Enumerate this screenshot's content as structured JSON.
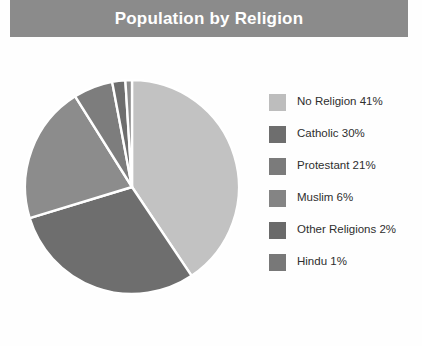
{
  "title": "Population by Religion",
  "theme": {
    "title_bar_bg": "#8b8b8b",
    "title_text_color": "#ffffff",
    "page_bg": "#fefefe",
    "legend_text_color": "#2e2e2e",
    "slice_separator": "#ffffff"
  },
  "chart_data": {
    "type": "pie",
    "title": "Population by Religion",
    "xlabel": "",
    "ylabel": "",
    "legend_position": "right",
    "start_angle_deg": 0,
    "direction": "clockwise",
    "units": "percent",
    "categories": [
      "No Religion",
      "Catholic",
      "Protestant",
      "Muslim",
      "Other Religions",
      "Hindu"
    ],
    "values": [
      41,
      30,
      21,
      6,
      2,
      1
    ],
    "colors": [
      "#c2c2c2",
      "#6e6e6e",
      "#8c8c8c",
      "#7d7d7d",
      "#6e6e6e",
      "#8c8c8c"
    ],
    "slices": [
      {
        "label": "No Religion",
        "value": 41,
        "display": "No Religion 41%",
        "color": "#c2c2c2"
      },
      {
        "label": "Catholic",
        "value": 30,
        "display": "Catholic 30%",
        "color": "#6e6e6e"
      },
      {
        "label": "Protestant",
        "value": 21,
        "display": "Protestant 21%",
        "color": "#8c8c8c"
      },
      {
        "label": "Muslim",
        "value": 6,
        "display": "Muslim 6%",
        "color": "#7d7d7d"
      },
      {
        "label": "Other Religions",
        "value": 2,
        "display": "Other Religions 2%",
        "color": "#6e6e6e"
      },
      {
        "label": "Hindu",
        "value": 1,
        "display": "Hindu 1%",
        "color": "#8c8c8c"
      }
    ]
  },
  "legend": {
    "items": [
      {
        "label": "No Religion 41%",
        "color": "#bdbdbd"
      },
      {
        "label": "Catholic 30%",
        "color": "#6e6e6e"
      },
      {
        "label": "Protestant 21%",
        "color": "#7b7b7b"
      },
      {
        "label": "Muslim 6%",
        "color": "#848484"
      },
      {
        "label": "Other Religions 2%",
        "color": "#6a6a6a"
      },
      {
        "label": "Hindu 1%",
        "color": "#787878"
      }
    ]
  }
}
